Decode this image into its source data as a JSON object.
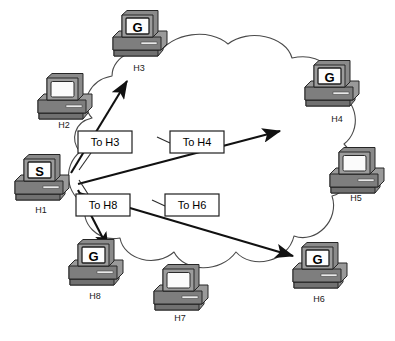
{
  "diagram": {
    "background_color": "#ffffff",
    "line_color": "#1a1a1a",
    "cloud": {
      "name": "network-cloud",
      "stroke": "#3a3a3a",
      "fill": "#ffffff"
    },
    "hosts": [
      {
        "id": "H3",
        "label": "H3",
        "screen_letter": "G",
        "type": "gateway",
        "x": 139,
        "y": 33,
        "label_x": 139,
        "label_y": 71
      },
      {
        "id": "H2",
        "label": "H2",
        "screen_letter": "",
        "type": "host",
        "x": 64,
        "y": 96,
        "label_x": 64,
        "label_y": 128
      },
      {
        "id": "H4",
        "label": "H4",
        "screen_letter": "G",
        "type": "gateway",
        "x": 331,
        "y": 83,
        "label_x": 337,
        "label_y": 122
      },
      {
        "id": "H1",
        "label": "H1",
        "screen_letter": "S",
        "type": "source",
        "x": 41,
        "y": 177,
        "label_x": 41,
        "label_y": 213
      },
      {
        "id": "H5",
        "label": "H5",
        "screen_letter": "",
        "type": "host",
        "x": 356,
        "y": 170,
        "label_x": 356,
        "label_y": 201
      },
      {
        "id": "H8",
        "label": "H8",
        "screen_letter": "G",
        "type": "gateway",
        "x": 95,
        "y": 262,
        "label_x": 95,
        "label_y": 299
      },
      {
        "id": "H6",
        "label": "H6",
        "screen_letter": "G",
        "type": "gateway",
        "x": 319,
        "y": 265,
        "label_x": 319,
        "label_y": 302
      },
      {
        "id": "H7",
        "label": "H7",
        "screen_letter": "",
        "type": "host",
        "x": 180,
        "y": 287,
        "label_x": 180,
        "label_y": 321
      }
    ],
    "packets": [
      {
        "id": "to-h3",
        "label": "To H3",
        "box_x": 78,
        "box_y": 131,
        "box_w": 54,
        "box_h": 22,
        "leader": "M 91 153 L 78 169"
      },
      {
        "id": "to-h4",
        "label": "To H4",
        "box_x": 170,
        "box_y": 131,
        "box_w": 54,
        "box_h": 22,
        "leader": "M 170 142 L 156 136"
      },
      {
        "id": "to-h8",
        "label": "To H8",
        "box_x": 76,
        "box_y": 194,
        "box_w": 54,
        "box_h": 22,
        "leader": "M 88 194 L 78 180"
      },
      {
        "id": "to-h6",
        "label": "To H6",
        "box_x": 165,
        "box_y": 194,
        "box_w": 54,
        "box_h": 22,
        "leader": "M 165 205 L 152 199"
      }
    ],
    "arrows": [
      {
        "id": "arrow-to-h3",
        "from_label": "H1",
        "to_label": "H3",
        "path": "M 71 173 L 127 81"
      },
      {
        "id": "arrow-to-h4",
        "from_label": "H1",
        "to_label": "H4",
        "path": "M 78 184 L 280 131"
      },
      {
        "id": "arrow-to-h8",
        "from_label": "H1",
        "to_label": "H8",
        "path": "M 78 190 L 108 248"
      },
      {
        "id": "arrow-to-h6",
        "from_label": "H1",
        "to_label": "H6",
        "path": "M 79 193 L 293 256"
      }
    ]
  }
}
